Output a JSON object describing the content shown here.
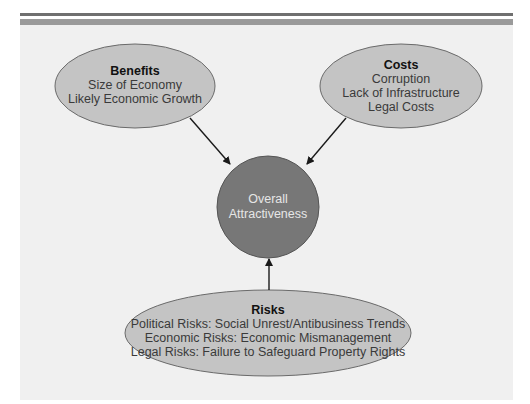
{
  "colors": {
    "panel_background": "#f0f0f0",
    "top_rule_dark": "#6f6f6f",
    "top_rule_gray": "#9a9a9a",
    "ellipse_fill": "#c4c4c4",
    "ellipse_stroke": "#6a6a6a",
    "center_fill": "#777777",
    "center_stroke": "#555555",
    "arrow": "#1a1a1a"
  },
  "nodes": {
    "benefits": {
      "title": "Benefits",
      "items": [
        "Size of Economy",
        "Likely Economic Growth"
      ]
    },
    "costs": {
      "title": "Costs",
      "items": [
        "Corruption",
        "Lack of Infrastructure",
        "Legal Costs"
      ]
    },
    "center": {
      "lines": [
        "Overall",
        "Attractiveness"
      ]
    },
    "risks": {
      "title": "Risks",
      "items": [
        "Political Risks: Social Unrest/Antibusiness Trends",
        "Economic Risks: Economic Mismanagement",
        "Legal Risks: Failure to Safeguard Property Rights"
      ]
    }
  },
  "edges": [
    {
      "from": "benefits",
      "to": "center"
    },
    {
      "from": "costs",
      "to": "center"
    },
    {
      "from": "risks",
      "to": "center"
    }
  ]
}
